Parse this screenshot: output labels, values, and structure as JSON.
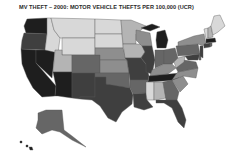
{
  "title": "MV THEFT – 2000: MOTOR VEHICLE THEFTS PER 100,000 (UCR)",
  "map": {
    "type": "choropleth",
    "region": "United States",
    "palette": {
      "c1": "#d8d8d8",
      "c2": "#b4b4b4",
      "c3": "#8e8e8e",
      "c4": "#666666",
      "c5": "#3f3f3f",
      "c6": "#1e1e1e"
    },
    "states": [
      {
        "id": "WA",
        "fill": "#1e1e1e",
        "d": "M27,19 L47,18 L47,34 L26,33 L24,26 Z"
      },
      {
        "id": "OR",
        "fill": "#3f3f3f",
        "d": "M24,33 L47,34 L45,50 L21,49 L22,40 Z"
      },
      {
        "id": "CA",
        "fill": "#1e1e1e",
        "d": "M21,49 L36,50 L36,63 L56,86 L55,96 L42,97 L33,88 L27,77 L22,64 Z"
      },
      {
        "id": "NV",
        "fill": "#1e1e1e",
        "d": "M36,50 L55,50 L52,78 L36,63 Z"
      },
      {
        "id": "ID",
        "fill": "#d8d8d8",
        "d": "M47,18 L51,18 L54,30 L60,38 L58,53 L45,50 L47,34 Z"
      },
      {
        "id": "MT",
        "fill": "#d8d8d8",
        "d": "M51,18 L95,19 L95,38 L60,38 L54,30 Z"
      },
      {
        "id": "WY",
        "fill": "#d8d8d8",
        "d": "M62,38 L95,38 L95,55 L62,55 Z"
      },
      {
        "id": "UT",
        "fill": "#b4b4b4",
        "d": "M55,50 L62,50 L62,55 L72,55 L72,72 L53,72 Z"
      },
      {
        "id": "AZ",
        "fill": "#1e1e1e",
        "d": "M53,72 L72,72 L72,98 L58,96 L55,96 L56,86 Z"
      },
      {
        "id": "CO",
        "fill": "#666666",
        "d": "M72,55 L100,55 L100,73 L72,73 Z"
      },
      {
        "id": "NM",
        "fill": "#3f3f3f",
        "d": "M72,73 L95,73 L95,97 L80,97 L80,99 L72,98 Z"
      },
      {
        "id": "ND",
        "fill": "#d8d8d8",
        "d": "M95,19 L121,20 L122,34 L95,34 Z"
      },
      {
        "id": "SD",
        "fill": "#d8d8d8",
        "d": "M95,34 L122,34 L123,48 L95,48 Z"
      },
      {
        "id": "NE",
        "fill": "#8e8e8e",
        "d": "M95,48 L123,48 L127,60 L100,60 L100,55 L95,55 Z"
      },
      {
        "id": "KS",
        "fill": "#8e8e8e",
        "d": "M100,60 L127,60 L129,73 L100,73 Z"
      },
      {
        "id": "OK",
        "fill": "#666666",
        "d": "M95,73 L129,73 L130,88 L112,86 L106,84 L106,77 L95,77 Z"
      },
      {
        "id": "TX",
        "fill": "#3f3f3f",
        "d": "M95,77 L106,77 L106,84 L130,88 L133,95 L132,104 L122,112 L116,122 L108,118 L100,106 L92,100 L80,99 L80,97 L95,97 Z"
      },
      {
        "id": "MN",
        "fill": "#b4b4b4",
        "d": "M121,20 L131,20 L146,26 L136,34 L136,44 L123,44 Z"
      },
      {
        "id": "IA",
        "fill": "#b4b4b4",
        "d": "M123,44 L142,44 L145,52 L141,58 L125,58 Z"
      },
      {
        "id": "MO",
        "fill": "#3f3f3f",
        "d": "M125,58 L141,58 L146,64 L149,76 L148,80 L130,80 L129,73 L127,60 Z"
      },
      {
        "id": "AR",
        "fill": "#666666",
        "d": "M130,80 L148,80 L146,93 L133,94 L130,88 Z"
      },
      {
        "id": "LA",
        "fill": "#3f3f3f",
        "d": "M133,94 L146,93 L147,100 L153,107 L144,110 L134,107 Z"
      },
      {
        "id": "WI",
        "fill": "#8e8e8e",
        "d": "M136,30 L150,33 L152,46 L142,46 L136,40 Z"
      },
      {
        "id": "IL",
        "fill": "#3f3f3f",
        "d": "M142,46 L152,46 L155,60 L152,74 L146,72 L146,64 L141,58 L145,52 Z"
      },
      {
        "id": "MI",
        "fill": "#1e1e1e",
        "d": "M157,32 L165,30 L168,40 L166,48 L157,48 L156,40 Z M141,28 L152,24 L160,27 L150,31 Z"
      },
      {
        "id": "IN",
        "fill": "#666666",
        "d": "M155,50 L164,50 L164,64 L155,68 Z"
      },
      {
        "id": "OH",
        "fill": "#666666",
        "d": "M164,50 L175,48 L178,58 L172,64 L164,64 Z"
      },
      {
        "id": "KY",
        "fill": "#8e8e8e",
        "d": "M152,70 L164,64 L172,64 L176,68 L168,74 L150,76 Z"
      },
      {
        "id": "TN",
        "fill": "#1e1e1e",
        "d": "M149,76 L180,73 L178,80 L148,82 Z"
      },
      {
        "id": "MS",
        "fill": "#d8d8d8",
        "d": "M146,82 L154,82 L154,100 L147,100 L146,93 Z"
      },
      {
        "id": "AL",
        "fill": "#b4b4b4",
        "d": "M154,82 L163,82 L166,98 L156,100 L154,100 Z"
      },
      {
        "id": "GA",
        "fill": "#666666",
        "d": "M163,82 L172,80 L179,92 L177,100 L166,100 Z"
      },
      {
        "id": "FL",
        "fill": "#3f3f3f",
        "d": "M156,100 L177,100 L182,108 L186,120 L184,128 L178,122 L172,108 L164,103 L156,103 Z"
      },
      {
        "id": "SC",
        "fill": "#8e8e8e",
        "d": "M172,80 L183,76 L188,84 L180,92 Z"
      },
      {
        "id": "NC",
        "fill": "#8e8e8e",
        "d": "M178,72 L198,68 L196,78 L183,76 L172,80 L176,74 Z"
      },
      {
        "id": "VA",
        "fill": "#666666",
        "d": "M176,68 L184,60 L196,62 L198,68 L178,72 Z"
      },
      {
        "id": "WV",
        "fill": "#b4b4b4",
        "d": "M178,58 L185,56 L184,62 L176,68 L174,62 Z"
      },
      {
        "id": "PA",
        "fill": "#666666",
        "d": "M176,46 L198,44 L200,54 L178,56 Z"
      },
      {
        "id": "MD",
        "fill": "#3f3f3f",
        "d": "M185,56 L200,54 L198,60 L188,60 Z"
      },
      {
        "id": "DE",
        "fill": "#666666",
        "d": "M199,54 L201,54 L201,60 L199,60 Z"
      },
      {
        "id": "NJ",
        "fill": "#3f3f3f",
        "d": "M200,46 L203,46 L203,58 L200,56 Z"
      },
      {
        "id": "NY",
        "fill": "#8e8e8e",
        "d": "M178,42 L194,36 L204,34 L206,44 L203,46 L198,44 L178,46 Z"
      },
      {
        "id": "CT",
        "fill": "#3f3f3f",
        "d": "M204,44 L210,43 L210,47 L204,48 Z"
      },
      {
        "id": "RI",
        "fill": "#666666",
        "d": "M210,43 L212,43 L212,46 L210,47 Z"
      },
      {
        "id": "MA",
        "fill": "#1e1e1e",
        "d": "M206,39 L215,38 L216,42 L206,43 Z"
      },
      {
        "id": "VT",
        "fill": "#d8d8d8",
        "d": "M204,29 L208,28 L208,38 L206,39 Z"
      },
      {
        "id": "NH",
        "fill": "#b4b4b4",
        "d": "M208,28 L211,26 L213,37 L208,38 Z"
      },
      {
        "id": "ME",
        "fill": "#d8d8d8",
        "d": "M211,26 L214,16 L220,15 L225,26 L218,32 L213,35 Z"
      },
      {
        "id": "AK",
        "fill": "#666666",
        "d": "M38,113 L46,110 L62,110 L64,130 L72,136 L86,147 L80,144 L72,140 L60,132 L52,130 L42,134 L36,128 L38,120 Z"
      },
      {
        "id": "HI",
        "fill": "#1e1e1e",
        "d": "M26,145 L28,145 L28,147 L26,147 Z M29,147 L32,147 L33,150 L30,150 Z M20,141 L22,141 L22,143 L20,143 Z"
      }
    ]
  }
}
